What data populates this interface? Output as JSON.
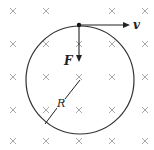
{
  "diagram": {
    "field": {
      "symbol": "×",
      "meaning": "magnetic field into page",
      "color": "#a8a8a8",
      "xs": [
        13,
        46,
        79,
        112,
        145
      ],
      "ys": [
        11,
        44,
        77,
        110,
        141
      ]
    },
    "circle": {
      "cx": 80,
      "cy": 80,
      "r": 54,
      "color": "#333333"
    },
    "labels": {
      "velocity": "v",
      "force": "F",
      "radius": "R"
    }
  }
}
